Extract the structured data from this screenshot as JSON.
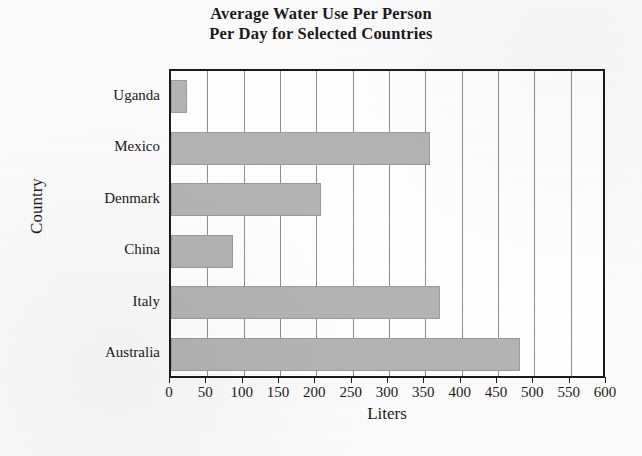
{
  "chart_data": {
    "type": "bar",
    "orientation": "horizontal",
    "title": "Average Water Use Per Person Per Day for Selected Countries",
    "title_lines": [
      "Average Water Use Per Person",
      "Per Day for Selected Countries"
    ],
    "xlabel": "Liters",
    "ylabel": "Country",
    "categories": [
      "Uganda",
      "Mexico",
      "Denmark",
      "China",
      "Italy",
      "Australia"
    ],
    "values": [
      22,
      357,
      207,
      86,
      370,
      480
    ],
    "xlim": [
      0,
      600
    ],
    "xticks": [
      0,
      50,
      100,
      150,
      200,
      250,
      300,
      350,
      400,
      450,
      500,
      550,
      600
    ],
    "xtick_labels": [
      "0",
      "50",
      "100",
      "150",
      "200",
      "250",
      "300",
      "350",
      "400",
      "450",
      "500",
      "550",
      "600"
    ],
    "grid": "vertical",
    "legend": "none",
    "bar_color": "#b4b4b4",
    "frame_color": "#1b1b1b",
    "plot_background": "#ffffff",
    "page_background": "#fbfbfb"
  }
}
